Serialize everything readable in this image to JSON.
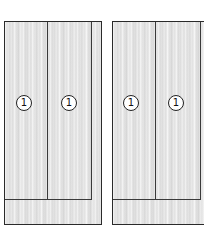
{
  "diagram": {
    "cabinets": [
      {
        "id": "left",
        "doors": [
          {
            "marker": "1"
          },
          {
            "marker": "1"
          }
        ]
      },
      {
        "id": "right",
        "doors": [
          {
            "marker": "1"
          },
          {
            "marker": "1"
          }
        ]
      }
    ],
    "colors": {
      "outline": "#2a2a2a",
      "wood": "#e4e4e4",
      "marker_fill": "#ffffff"
    }
  }
}
